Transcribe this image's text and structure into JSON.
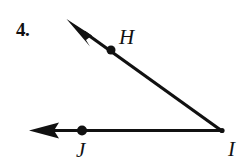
{
  "document": {
    "background_color": "#ffffff",
    "ink_color": "#111111",
    "width": 249,
    "height": 164
  },
  "problem": {
    "number_label": "4.",
    "figure_type": "geometry-angle-diagram"
  },
  "figure": {
    "vertex": {
      "name": "I",
      "label": "I",
      "x": 222,
      "y": 131
    },
    "points": [
      {
        "name": "H",
        "label": "H",
        "x": 111,
        "y": 50,
        "dot_radius": 4.5,
        "label_x": 119,
        "label_y": 27
      },
      {
        "name": "J",
        "label": "J",
        "x": 82,
        "y": 130,
        "dot_radius": 5,
        "label_x": 76,
        "label_y": 140
      }
    ],
    "rays": [
      {
        "name": "ray-IH",
        "label": "ray IH",
        "from_x": 222,
        "from_y": 131,
        "to_x": 67,
        "to_y": 20,
        "stroke_width": 3.2,
        "arrowhead": "open-end"
      },
      {
        "name": "ray-IJ",
        "label": "ray IJ",
        "from_x": 222,
        "from_y": 131,
        "to_x": 30,
        "to_y": 130,
        "stroke_width": 3.2,
        "arrowhead": "open-end"
      }
    ]
  }
}
